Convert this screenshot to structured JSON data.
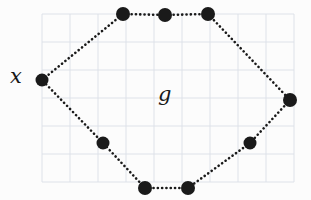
{
  "figure": {
    "background_color": "#fcfcfc",
    "ink_color": "#1a1a1a",
    "grid": {
      "line_color": "#dbe0e8",
      "cell_size": 28,
      "origin_x": 42,
      "origin_y": 14,
      "columns": 9,
      "rows": 6,
      "visible": true
    },
    "labels": [
      {
        "id": "x",
        "text": "x",
        "x": 10,
        "y": 66,
        "style": "italic-serif",
        "refers_to": "vertex-left"
      },
      {
        "id": "g",
        "text": "g",
        "x": 158,
        "y": 84,
        "style": "italic-serif",
        "refers_to": "graph-interior"
      }
    ],
    "vertices": [
      {
        "id": "v-left",
        "label": "x",
        "x": 42,
        "y": 80,
        "r": 6.5
      },
      {
        "id": "v-top-left",
        "label": "",
        "x": 123,
        "y": 14,
        "r": 7.0
      },
      {
        "id": "v-top-mid",
        "label": "",
        "x": 165,
        "y": 15,
        "r": 7.0
      },
      {
        "id": "v-top-right",
        "label": "",
        "x": 208,
        "y": 14,
        "r": 7.0
      },
      {
        "id": "v-right",
        "label": "",
        "x": 290,
        "y": 100,
        "r": 7.0
      },
      {
        "id": "v-bottom-right",
        "label": "",
        "x": 250,
        "y": 143,
        "r": 6.5
      },
      {
        "id": "v-bottom-mid",
        "label": "",
        "x": 188,
        "y": 188,
        "r": 7.0
      },
      {
        "id": "v-bottom-left",
        "label": "",
        "x": 145,
        "y": 188,
        "r": 7.0
      },
      {
        "id": "v-left-lower",
        "label": "",
        "x": 103,
        "y": 143,
        "r": 6.5
      }
    ],
    "edges": [
      {
        "from": "v-left",
        "to": "v-top-left",
        "style": "dotted"
      },
      {
        "from": "v-top-left",
        "to": "v-top-mid",
        "style": "dotted"
      },
      {
        "from": "v-top-mid",
        "to": "v-top-right",
        "style": "dotted"
      },
      {
        "from": "v-top-right",
        "to": "v-right",
        "style": "dotted"
      },
      {
        "from": "v-right",
        "to": "v-bottom-right",
        "style": "dotted"
      },
      {
        "from": "v-bottom-right",
        "to": "v-bottom-mid",
        "style": "dotted"
      },
      {
        "from": "v-bottom-mid",
        "to": "v-bottom-left",
        "style": "dotted"
      },
      {
        "from": "v-bottom-left",
        "to": "v-left-lower",
        "style": "dotted"
      },
      {
        "from": "v-left-lower",
        "to": "v-left",
        "style": "dotted"
      }
    ]
  }
}
